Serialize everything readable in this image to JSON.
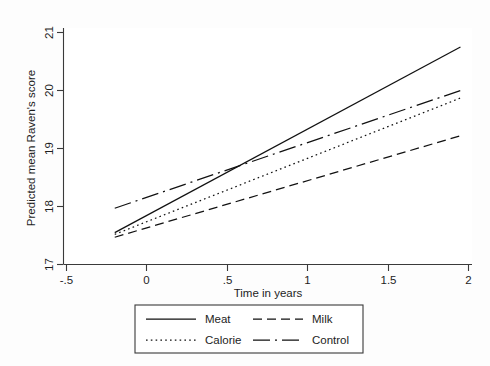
{
  "chart_data": {
    "type": "line",
    "title": "",
    "xlabel": "Time in years",
    "ylabel": "Predicted mean Raven's score",
    "xlim": [
      -0.5,
      2.0
    ],
    "ylim": [
      17,
      21
    ],
    "xticks": [
      -0.5,
      0,
      0.5,
      1,
      1.5,
      2
    ],
    "xtick_labels": [
      "-.5",
      "0",
      ".5",
      "1",
      "1.5",
      "2"
    ],
    "yticks": [
      17,
      18,
      19,
      20,
      21
    ],
    "ytick_labels": [
      "17",
      "18",
      "19",
      "20",
      "21"
    ],
    "grid": false,
    "legend_position": "bottom",
    "x": [
      -0.2,
      1.95
    ],
    "series": [
      {
        "name": "Meat",
        "style": "solid",
        "dasharray": "none",
        "color": "#111111",
        "values": [
          17.55,
          20.75
        ]
      },
      {
        "name": "Milk",
        "style": "dashed",
        "dasharray": "9,5",
        "color": "#111111",
        "values": [
          17.47,
          19.22
        ]
      },
      {
        "name": "Calorie",
        "style": "dotted",
        "dasharray": "1.6,3.2",
        "color": "#111111",
        "values": [
          17.52,
          19.87
        ]
      },
      {
        "name": "Control",
        "style": "long-dash-dot",
        "dasharray": "17,5,2,5",
        "color": "#111111",
        "values": [
          17.97,
          20.0
        ]
      }
    ]
  },
  "axes": {
    "y_title": "Predicted mean Raven's score",
    "x_title": "Time in years",
    "y_labels": {
      "t21": "21",
      "t20": "20",
      "t19": "19",
      "t18": "18",
      "t17": "17"
    },
    "x_labels": {
      "tm05": "-.5",
      "t0": "0",
      "t05": ".5",
      "t1": "1",
      "t15": "1.5",
      "t2": "2"
    }
  },
  "legend": {
    "entries": {
      "meat": "Meat",
      "milk": "Milk",
      "calorie": "Calorie",
      "control": "Control"
    }
  }
}
